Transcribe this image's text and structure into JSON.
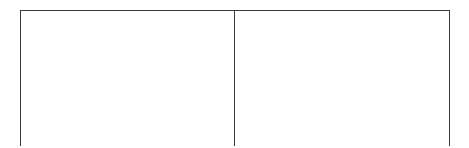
{
  "document": {
    "type": "table",
    "description": "Empty two-column table outline, clipped at the bottom edge of the page",
    "border_color": "#3a3a3a",
    "background_color": "#ffffff",
    "table": {
      "columns": 2,
      "rows": 1,
      "column_headers": [
        "",
        ""
      ],
      "rows_data": [
        {
          "cells": [
            "",
            ""
          ]
        }
      ]
    }
  }
}
